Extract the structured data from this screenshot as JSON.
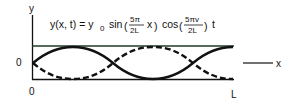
{
  "diagram": {
    "equation": {
      "lhs": "y(x, t) = y",
      "lhs_sub": "0",
      "sin_label": "sin",
      "sin_num": "5π",
      "sin_den": "2L",
      "sin_var": "x",
      "cos_label": "cos",
      "cos_num": "5πv",
      "cos_den": "2L",
      "cos_var": "t"
    },
    "axes": {
      "y_label": "y",
      "x_label": "x",
      "y_zero_label": "0",
      "x_zero_label": "0",
      "x_end_label": "L"
    },
    "curves": [
      {
        "name": "solid",
        "style": "solid",
        "function": "+sin(5πx/2L)"
      },
      {
        "name": "dashed",
        "style": "dashed",
        "function": "-sin(5πx/2L)"
      }
    ],
    "colors": {
      "ink": "#111111",
      "top_border": "#1f3a2a",
      "background": "#ffffff"
    }
  }
}
